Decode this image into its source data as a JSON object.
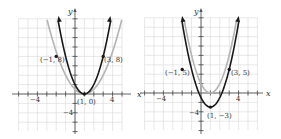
{
  "chart_data": [
    {
      "type": "line",
      "title": "",
      "xlabel": "x",
      "ylabel": "y",
      "x_ticks_labeled": [
        -4,
        4
      ],
      "y_ticks_labeled": [
        -4
      ],
      "xlim": [
        -6,
        5
      ],
      "ylim": [
        -7,
        16
      ],
      "grid": true,
      "series": [
        {
          "name": "reference parabola",
          "color": "#b4b4b4",
          "equation": "y = (x - 1)^2",
          "vertex": [
            1,
            0
          ]
        },
        {
          "name": "transformed parabola",
          "color": "#1a1a1a",
          "equation": "y = 2(x - 1)^2",
          "vertex": [
            1,
            0
          ]
        }
      ],
      "points": [
        {
          "label": "(−1, 8)",
          "x": -1,
          "y": 8
        },
        {
          "label": "(3, 8)",
          "x": 3,
          "y": 8
        },
        {
          "label": "(1, 0)",
          "x": 1,
          "y": 0
        }
      ]
    },
    {
      "type": "line",
      "title": "",
      "xlabel": "x",
      "ylabel": "y",
      "x_ticks_labeled": [
        -4,
        4
      ],
      "y_ticks_labeled": [
        -4
      ],
      "xlim": [
        -6,
        6
      ],
      "ylim": [
        -7,
        16
      ],
      "grid": true,
      "series": [
        {
          "name": "reference parabola",
          "color": "#b4b4b4",
          "equation": "y = 2(x - 1)^2",
          "vertex": [
            1,
            0
          ]
        },
        {
          "name": "transformed parabola",
          "color": "#1a1a1a",
          "equation": "y = 2(x - 1)^2 - 3",
          "vertex": [
            1,
            -3
          ]
        }
      ],
      "points": [
        {
          "label": "(−1, 5)",
          "x": -1,
          "y": 5
        },
        {
          "label": "(3, 5)",
          "x": 3,
          "y": 5
        },
        {
          "label": "(1, −3)",
          "x": 1,
          "y": -3
        }
      ]
    }
  ],
  "labels": {
    "left": {
      "x_axis": "x",
      "y_axis": "y",
      "tick_neg4_x": "−4",
      "tick_4_x": "4",
      "tick_neg4_y": "−4",
      "p1": "(−1, 8)",
      "p2": "(3, 8)",
      "vertex": "(1, 0)"
    },
    "right": {
      "x_axis": "x",
      "y_axis": "y",
      "tick_neg4_x": "−4",
      "tick_4_x": "4",
      "tick_neg4_y": "−4",
      "p1": "(−1, 5)",
      "p2": "(3, 5)",
      "vertex": "(1, −3)"
    }
  }
}
